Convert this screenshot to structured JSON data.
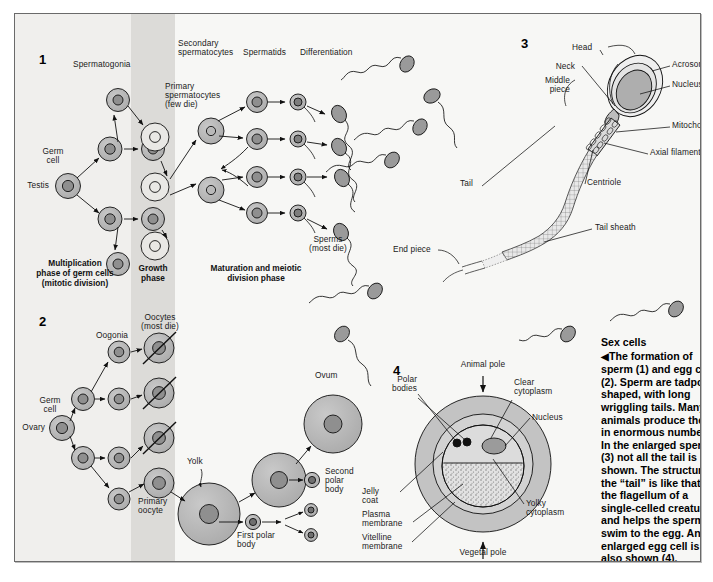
{
  "figure": {
    "panels": [
      {
        "number": "1",
        "name": "spermatogenesis"
      },
      {
        "number": "2",
        "name": "oogenesis"
      },
      {
        "number": "3",
        "name": "sperm-anatomy"
      },
      {
        "number": "4",
        "name": "egg-cell-anatomy"
      }
    ]
  },
  "colors": {
    "page_background": "#ffffff",
    "panel_background": "#f7f7f5",
    "band_left": "#f0efed",
    "band_growth": "#dcdbd8",
    "cell_fill": "#b3b3b3",
    "nucleus_fill": "#8f8f8f",
    "border": "#6a6a6a",
    "text": "#1a1a1a"
  },
  "panel1": {
    "number": "1",
    "labels": {
      "testis": "Testis",
      "germ_cell": "Germ\ncell",
      "germ_cell_l1": "Germ",
      "germ_cell_l2": "cell",
      "spermatogonia": "Spermatogonia",
      "primary_spermatocytes_l1": "Primary",
      "primary_spermatocytes_l2": "spermatocytes",
      "primary_spermatocytes_l3": "(few die)",
      "secondary_spermatocytes_l1": "Secondary",
      "secondary_spermatocytes_l2": "spermatocytes",
      "spermatids": "Spermatids",
      "differentiation": "Differentiation",
      "sperms_l1": "Sperms",
      "sperms_l2": "(most die)"
    },
    "phases": {
      "multiplication_l1": "Multiplication",
      "multiplication_l2": "phase of germ cells",
      "multiplication_l3": "(mitotic division)",
      "growth_l1": "Growth",
      "growth_l2": "phase",
      "maturation_l1": "Maturation and meiotic",
      "maturation_l2": "division phase"
    }
  },
  "panel2": {
    "number": "2",
    "labels": {
      "ovary": "Ovary",
      "germ_cell_l1": "Germ",
      "germ_cell_l2": "cell",
      "oogonia": "Oogonia",
      "oocytes_l1": "Oocytes",
      "oocytes_l2": "(most die)",
      "primary_oocyte_l1": "Primary",
      "primary_oocyte_l2": "oocyte",
      "yolk": "Yolk",
      "ovum": "Ovum",
      "first_polar_body_l1": "First polar",
      "first_polar_body_l2": "body",
      "second_polar_body_l1": "Second",
      "second_polar_body_l2": "polar",
      "second_polar_body_l3": "body"
    }
  },
  "panel3": {
    "number": "3",
    "labels": {
      "head": "Head",
      "neck": "Neck",
      "middle_piece_l1": "Middle",
      "middle_piece_l2": "piece",
      "tail": "Tail",
      "end_piece": "End piece",
      "acrosome": "Acrosome",
      "nucleus": "Nucleus",
      "mitochondrion": "Mitochondrion",
      "axial_filament": "Axial filament",
      "centriole": "Centriole",
      "tail_sheath": "Tail sheath"
    }
  },
  "panel4": {
    "number": "4",
    "labels": {
      "animal_pole": "Animal pole",
      "vegetal_pole": "Vegetal pole",
      "polar_bodies_l1": "Polar",
      "polar_bodies_l2": "bodies",
      "clear_cytoplasm_l1": "Clear",
      "clear_cytoplasm_l2": "cytoplasm",
      "nucleus": "Nucleus",
      "yolky_cytoplasm_l1": "Yolky",
      "yolky_cytoplasm_l2": "cytoplasm",
      "jelly_coat_l1": "Jelly",
      "jelly_coat_l2": "coat",
      "plasma_membrane_l1": "Plasma",
      "plasma_membrane_l2": "membrane",
      "vitelline_membrane_l1": "Vitelline",
      "vitelline_membrane_l2": "membrane"
    }
  },
  "caption": {
    "heading": "Sex cells",
    "arrow": "◀",
    "body": "The formation of sperm (1) and egg cells (2). Sperm are tadpole-shaped, with long wriggling tails. Many animals produce them in enormous numbers. In the enlarged sperm (3) not all the tail is shown. The structure of the “tail” is like that of the flagellum of a single-celled creature, and helps the sperm to swim to the egg. An enlarged egg cell is also shown (4)."
  }
}
